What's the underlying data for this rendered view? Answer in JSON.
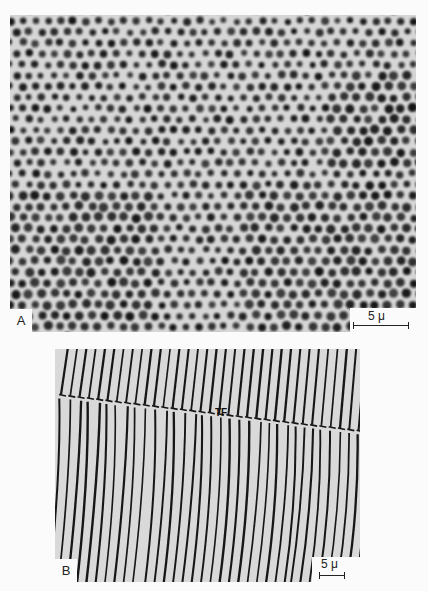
{
  "figure": {
    "panels": [
      {
        "id": "A",
        "label": "A",
        "description": "Hexagonal array of dark dots (micrograph)",
        "scale_bar_label": "5 μ",
        "background_color": "#d6d6d6",
        "feature_color": "#141414"
      },
      {
        "id": "B",
        "label": "B",
        "description": "Parallel stripe pattern with a transverse fault line",
        "scale_bar_label": "5 μ",
        "annotation": "TF",
        "background_color": "#d9d9d9",
        "feature_color": "#151515"
      }
    ]
  }
}
